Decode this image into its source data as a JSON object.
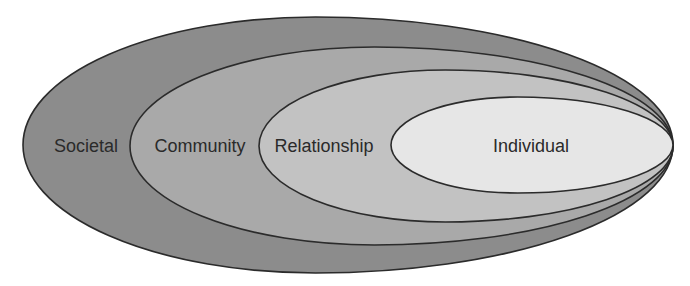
{
  "diagram": {
    "type": "nested-ellipses",
    "layers": [
      {
        "id": "societal",
        "label": "Societal",
        "fill": "#8c8c8c",
        "shape": {
          "left": 23,
          "right": 673,
          "top": 17,
          "bottom": 273
        },
        "label_x": 86
      },
      {
        "id": "community",
        "label": "Community",
        "fill": "#a9a9a9",
        "shape": {
          "left": 130,
          "right": 673,
          "top": 47,
          "bottom": 245
        },
        "label_x": 200
      },
      {
        "id": "relationship",
        "label": "Relationship",
        "fill": "#c2c2c2",
        "shape": {
          "left": 259,
          "right": 673,
          "top": 70,
          "bottom": 222
        },
        "label_x": 324
      },
      {
        "id": "individual",
        "label": "Individual",
        "fill": "#e6e6e6",
        "shape": {
          "left": 391,
          "right": 673,
          "top": 97,
          "bottom": 193
        },
        "label_x": 531
      }
    ],
    "label_baseline_y": 152,
    "stroke_color": "#2b2b2b"
  }
}
